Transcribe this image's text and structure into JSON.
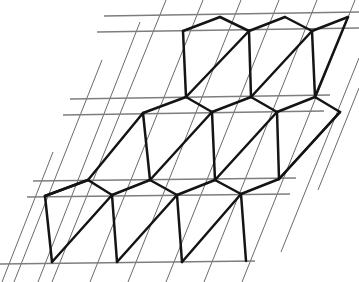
{
  "figure": {
    "type": "geometric-diagram",
    "background_color": "#ffffff",
    "canvas": {
      "width": 359,
      "height": 282
    },
    "grid": {
      "description": "Thin parallelogram grid: pairs of near-horizontal lines crossed by steep up-right diagonals",
      "color": "#5a5a5a",
      "horizontal_color": "#7d7d7d",
      "stroke_width": 0.9,
      "horizontal_stroke_width": 1.6,
      "horizontal_lines": [
        {
          "x1": 104,
          "y1": 16,
          "x2": 359,
          "y2": 12
        },
        {
          "x1": 97,
          "y1": 32,
          "x2": 359,
          "y2": 28
        },
        {
          "x1": 70,
          "y1": 99,
          "x2": 330,
          "y2": 95
        },
        {
          "x1": 63,
          "y1": 115,
          "x2": 324,
          "y2": 111
        },
        {
          "x1": 33,
          "y1": 181,
          "x2": 296,
          "y2": 178
        },
        {
          "x1": 27,
          "y1": 197,
          "x2": 290,
          "y2": 194
        },
        {
          "x1": 0,
          "y1": 264,
          "x2": 255,
          "y2": 261
        }
      ],
      "diagonal_lines": [
        {
          "x1": 2,
          "y1": 282,
          "x2": 53,
          "y2": 152
        },
        {
          "x1": 14,
          "y1": 282,
          "x2": 102,
          "y2": 60
        },
        {
          "x1": 38,
          "y1": 282,
          "x2": 140,
          "y2": 22
        },
        {
          "x1": 52,
          "y1": 282,
          "x2": 166,
          "y2": 0
        },
        {
          "x1": 90,
          "y1": 282,
          "x2": 203,
          "y2": 0
        },
        {
          "x1": 128,
          "y1": 282,
          "x2": 241,
          "y2": 0
        },
        {
          "x1": 166,
          "y1": 282,
          "x2": 279,
          "y2": 0
        },
        {
          "x1": 204,
          "y1": 282,
          "x2": 317,
          "y2": 0
        },
        {
          "x1": 242,
          "y1": 282,
          "x2": 355,
          "y2": 0
        },
        {
          "x1": 281,
          "y1": 252,
          "x2": 359,
          "y2": 58
        },
        {
          "x1": 318,
          "y1": 190,
          "x2": 359,
          "y2": 88
        }
      ]
    },
    "lattice": {
      "description": "Bold hexagonal cells, each divided by a diagonal from lower-left to upper-right vertex",
      "color": "#141414",
      "stroke_width": 2.5,
      "vertices": [
        {
          "id": "a1",
          "x": 183,
          "y": 31
        },
        {
          "id": "a2",
          "x": 220,
          "y": 17
        },
        {
          "id": "a3",
          "x": 249,
          "y": 31
        },
        {
          "id": "a4",
          "x": 285,
          "y": 17
        },
        {
          "id": "a5",
          "x": 312,
          "y": 31
        },
        {
          "id": "a6",
          "x": 348,
          "y": 17
        },
        {
          "id": "b1",
          "x": 186,
          "y": 97
        },
        {
          "id": "b2",
          "x": 251,
          "y": 97
        },
        {
          "id": "b3",
          "x": 315,
          "y": 97
        },
        {
          "id": "c1",
          "x": 143,
          "y": 113
        },
        {
          "id": "c2",
          "x": 212,
          "y": 112
        },
        {
          "id": "c3",
          "x": 277,
          "y": 112
        },
        {
          "id": "c4",
          "x": 340,
          "y": 112
        },
        {
          "id": "d1",
          "x": 88,
          "y": 180
        },
        {
          "id": "d2",
          "x": 150,
          "y": 180
        },
        {
          "id": "d3",
          "x": 215,
          "y": 180
        },
        {
          "id": "d4",
          "x": 279,
          "y": 179
        },
        {
          "id": "e1",
          "x": 45,
          "y": 196
        },
        {
          "id": "e2",
          "x": 112,
          "y": 195
        },
        {
          "id": "e3",
          "x": 177,
          "y": 195
        },
        {
          "id": "e4",
          "x": 241,
          "y": 194
        },
        {
          "id": "f1",
          "x": 52,
          "y": 262
        },
        {
          "id": "f2",
          "x": 117,
          "y": 262
        },
        {
          "id": "f3",
          "x": 182,
          "y": 262
        },
        {
          "id": "f4",
          "x": 246,
          "y": 261
        }
      ],
      "edges": [
        {
          "from": "a1",
          "to": "a2",
          "kind": "hex-side"
        },
        {
          "from": "a2",
          "to": "a3",
          "kind": "hex-side"
        },
        {
          "from": "a3",
          "to": "a4",
          "kind": "hex-side"
        },
        {
          "from": "a4",
          "to": "a5",
          "kind": "hex-side"
        },
        {
          "from": "a5",
          "to": "a6",
          "kind": "hex-side"
        },
        {
          "from": "a1",
          "to": "b1",
          "kind": "hex-vertical"
        },
        {
          "from": "a3",
          "to": "b2",
          "kind": "hex-vertical"
        },
        {
          "from": "a5",
          "to": "b3",
          "kind": "hex-vertical"
        },
        {
          "from": "b1",
          "to": "c2",
          "kind": "hex-side"
        },
        {
          "from": "c2",
          "to": "b2",
          "kind": "hex-side"
        },
        {
          "from": "b2",
          "to": "c3",
          "kind": "hex-side"
        },
        {
          "from": "c3",
          "to": "b3",
          "kind": "hex-side"
        },
        {
          "from": "b3",
          "to": "c4",
          "kind": "hex-side"
        },
        {
          "from": "b1",
          "to": "c1",
          "kind": "hex-side"
        },
        {
          "from": "b1",
          "to": "a3",
          "kind": "hex-diagonal"
        },
        {
          "from": "b2",
          "to": "a5",
          "kind": "hex-diagonal"
        },
        {
          "from": "b3",
          "to": "a6",
          "kind": "hex-diagonal"
        },
        {
          "from": "c1",
          "to": "d2",
          "kind": "hex-vertical"
        },
        {
          "from": "c2",
          "to": "d3",
          "kind": "hex-vertical"
        },
        {
          "from": "c3",
          "to": "d4",
          "kind": "hex-vertical"
        },
        {
          "from": "c4",
          "to": "d4",
          "kind": "hex-side"
        },
        {
          "from": "d1",
          "to": "c1",
          "kind": "hex-side"
        },
        {
          "from": "d2",
          "to": "e3",
          "kind": "hex-side"
        },
        {
          "from": "d1",
          "to": "e2",
          "kind": "hex-side"
        },
        {
          "from": "d2",
          "to": "e2",
          "kind": "hex-side"
        },
        {
          "from": "d3",
          "to": "e3",
          "kind": "hex-side"
        },
        {
          "from": "d3",
          "to": "e4",
          "kind": "hex-side"
        },
        {
          "from": "d4",
          "to": "e4",
          "kind": "hex-side"
        },
        {
          "from": "d1",
          "to": "e1",
          "kind": "hex-side"
        },
        {
          "from": "d2",
          "to": "c2",
          "kind": "hex-diagonal"
        },
        {
          "from": "d3",
          "to": "c3",
          "kind": "hex-diagonal"
        },
        {
          "from": "d4",
          "to": "c4",
          "kind": "hex-diagonal"
        },
        {
          "from": "e1",
          "to": "f1",
          "kind": "hex-vertical"
        },
        {
          "from": "e2",
          "to": "f2",
          "kind": "hex-vertical"
        },
        {
          "from": "e3",
          "to": "f3",
          "kind": "hex-vertical"
        },
        {
          "from": "e4",
          "to": "f4",
          "kind": "hex-vertical"
        },
        {
          "from": "f1",
          "to": "e2",
          "kind": "hex-diagonal"
        },
        {
          "from": "f2",
          "to": "e3",
          "kind": "hex-diagonal"
        },
        {
          "from": "f3",
          "to": "e4",
          "kind": "hex-diagonal"
        },
        {
          "from": "e1",
          "to": "d1",
          "kind": "hex-diagonal-long"
        }
      ]
    }
  }
}
